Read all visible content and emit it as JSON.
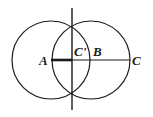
{
  "diagram": {
    "type": "geometric-construction",
    "circles": [
      {
        "name": "circle-centered-A",
        "cx": 51,
        "cy": 60,
        "r": 39
      },
      {
        "name": "circle-centered-B",
        "cx": 91,
        "cy": 60,
        "r": 39
      }
    ],
    "points": {
      "A": {
        "label": "A",
        "x": 51,
        "y": 60
      },
      "C_prime": {
        "label": "C'",
        "x": 72,
        "y": 60
      },
      "B": {
        "label": "B",
        "x": 91,
        "y": 60
      },
      "C": {
        "label": "C",
        "x": 130,
        "y": 60
      }
    },
    "segments": [
      {
        "name": "segment-A-Cprime",
        "from": "A",
        "to": "C'",
        "style": "thick"
      },
      {
        "name": "segment-Cprime-C",
        "from": "C'",
        "to": "C",
        "style": "normal"
      }
    ],
    "perpendicular_bisector": {
      "x": 72,
      "y1": 8,
      "y2": 110
    },
    "intersections": [
      {
        "x": 72,
        "y": 24
      },
      {
        "x": 72,
        "y": 96
      }
    ],
    "colors": {
      "stroke": "#1a1a1a",
      "background": "#ffffff"
    }
  }
}
